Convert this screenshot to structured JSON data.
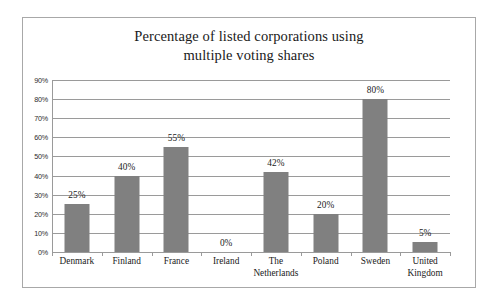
{
  "chart_data": {
    "type": "bar",
    "title": "Percentage of listed corporations using multiple voting shares",
    "title_lines": [
      "Percentage of listed corporations using",
      "multiple voting shares"
    ],
    "categories": [
      "Denmark",
      "Finland",
      "France",
      "Ireland",
      "The Netherlands",
      "Poland",
      "Sweden",
      "United Kingdom"
    ],
    "category_lines": [
      [
        "Denmark"
      ],
      [
        "Finland"
      ],
      [
        "France"
      ],
      [
        "Ireland"
      ],
      [
        "The",
        "Netherlands"
      ],
      [
        "Poland"
      ],
      [
        "Sweden"
      ],
      [
        "United",
        "Kingdom"
      ]
    ],
    "values": [
      25,
      40,
      55,
      0,
      42,
      20,
      80,
      5
    ],
    "data_labels": [
      "25%",
      "40%",
      "55%",
      "0%",
      "42%",
      "20%",
      "80%",
      "5%"
    ],
    "xlabel": "",
    "ylabel": "",
    "ylim": [
      0,
      90
    ],
    "ytick_values": [
      0,
      10,
      20,
      30,
      40,
      50,
      60,
      70,
      80,
      90
    ],
    "ytick_labels": [
      "0%",
      "10%",
      "20%",
      "30%",
      "40%",
      "50%",
      "60%",
      "70%",
      "80%",
      "90%"
    ],
    "grid": true,
    "legend": false,
    "bar_color": "#808080",
    "gridline_color": "#9a9a9a",
    "frame_color": "#a8a8a8",
    "background_color": "#ffffff"
  }
}
